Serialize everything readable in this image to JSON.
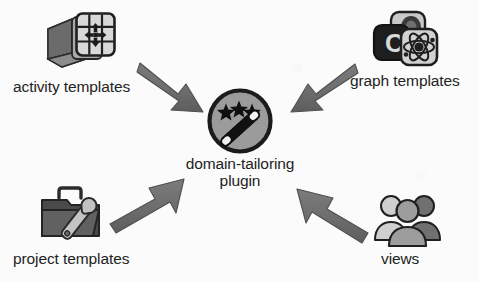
{
  "diagram": {
    "background_color": "#fbfbfb",
    "text_color": "#232323",
    "arrow_color": "#6e6e6e",
    "arrow_outline_color": "#4a4a4a",
    "center": {
      "label_line1": "domain-tailoring",
      "label_line2": "plugin",
      "icon_name": "magic-wand-stars-circle-icon",
      "circle_fill": "#9a9a9a",
      "circle_stroke": "#1b1b1b"
    },
    "nodes": [
      {
        "id": "activity-templates",
        "label": "activity templates",
        "icon_name": "grid-window-move-folder-icon",
        "position": "top-left",
        "arrow_direction": "to-center-down-right"
      },
      {
        "id": "graph-templates",
        "label": "graph templates",
        "icon_name": "stacked-tiles-atom-icon",
        "position": "top-right",
        "arrow_direction": "to-center-down-left"
      },
      {
        "id": "project-templates",
        "label": "project templates",
        "icon_name": "folder-wrench-icon",
        "position": "bottom-left",
        "arrow_direction": "to-center-up-right"
      },
      {
        "id": "views",
        "label": "views",
        "icon_name": "three-users-icon",
        "position": "bottom-right",
        "arrow_direction": "to-center-up-left"
      }
    ]
  }
}
